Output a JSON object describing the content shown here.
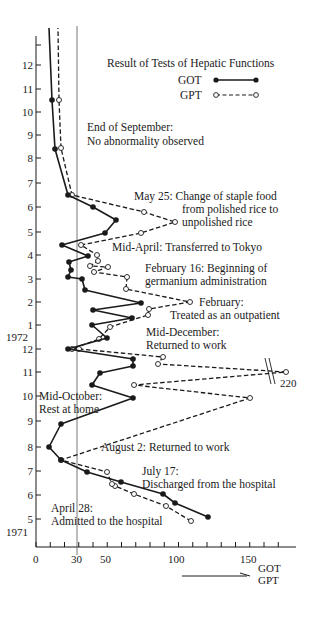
{
  "chart_data": {
    "type": "line",
    "title": "Result of Tests of Hepatic Functions",
    "xlabel": "GOT / GPT",
    "ylabel": "Month (1971-1972)",
    "xlim": [
      0,
      170
    ],
    "x_ticks": [
      0,
      30,
      50,
      100,
      150
    ],
    "x_minor_step": 10,
    "reference_line_x": 30,
    "y_ticks": [
      {
        "label": "5",
        "year": "1971"
      },
      {
        "label": "6"
      },
      {
        "label": "7"
      },
      {
        "label": "8"
      },
      {
        "label": "9"
      },
      {
        "label": "10"
      },
      {
        "label": "11"
      },
      {
        "label": "12"
      },
      {
        "label": "1",
        "year": "1972"
      },
      {
        "label": "2"
      },
      {
        "label": "3"
      },
      {
        "label": "4"
      },
      {
        "label": "5"
      },
      {
        "label": "6"
      },
      {
        "label": "7"
      },
      {
        "label": "8"
      },
      {
        "label": "9"
      },
      {
        "label": "10"
      },
      {
        "label": "11"
      },
      {
        "label": "12"
      }
    ],
    "year_labels": [
      "1971",
      "1972"
    ],
    "legend": [
      {
        "name": "GOT",
        "style": "solid line, filled circles"
      },
      {
        "name": "GPT",
        "style": "dashed line, open circles"
      }
    ],
    "legend_position": "top-right",
    "series": [
      {
        "name": "GOT",
        "approx_values_chronological": [
          120,
          98,
          95,
          58,
          51,
          36,
          18,
          24,
          44,
          69,
          68,
          23,
          50,
          45,
          9,
          24,
          32,
          17,
          41,
          17,
          73,
          40,
          25,
          16,
          26,
          31,
          50,
          38,
          21,
          57,
          48,
          12,
          23,
          11,
          8
        ]
      },
      {
        "name": "GPT",
        "approx_values_chronological": [
          110,
          91,
          69,
          55,
          53,
          50,
          16,
          150,
          69,
          220,
          86,
          89,
          31,
          26,
          45,
          53,
          54,
          108,
          64,
          63,
          41,
          40,
          51,
          38,
          43,
          32,
          45,
          101,
          124,
          76,
          25,
          16,
          13,
          12
        ]
      }
    ],
    "annotations": [
      {
        "text": "April 28:",
        "text2": "Admitted to the hospital"
      },
      {
        "text": "July 17:",
        "text2": "Discharged from the hospital"
      },
      {
        "text": "August 2:  Returned to work"
      },
      {
        "text": "Mid-October:",
        "text2": "Rest at home"
      },
      {
        "text": "Mid-December:",
        "text2": "Returned to work"
      },
      {
        "text": "February:",
        "text2": "Treated as an outpatient"
      },
      {
        "text": "February 16:  Beginning of",
        "text2": "germanium administration"
      },
      {
        "text": "Mid-April:  Transferred to Tokyo"
      },
      {
        "text": "May 25:  Change of staple food",
        "text2": "from polished rice to",
        "text3": "unpolished rice"
      },
      {
        "text": "End of September:",
        "text2": "No abnormality observed"
      }
    ],
    "break_label": "220",
    "x_arrow_labels": [
      "GOT",
      "GPT"
    ]
  },
  "render": {
    "axis_color": "#1a1a1a",
    "x_axis": {
      "y": 547,
      "x0": 36,
      "x1": 296,
      "px_per_unit": 1.425
    },
    "y_axis": {
      "x": 36,
      "top": 28
    },
    "ref_line_x": 77,
    "y_tick_px": [
      519,
      495,
      471,
      447,
      421,
      396,
      372,
      349,
      325,
      302,
      279,
      255,
      232,
      207,
      183,
      158,
      135,
      112,
      89,
      65,
      45
    ],
    "y_tick_labels": [
      "5",
      "6",
      "7",
      "8",
      "9",
      "10",
      "11",
      "12",
      "1",
      "2",
      "3",
      "4",
      "5",
      "6",
      "7",
      "8",
      "9",
      "10",
      "11",
      "12",
      ""
    ],
    "got_points": [
      [
        208,
        517
      ],
      [
        175,
        503
      ],
      [
        163,
        494
      ],
      [
        121,
        482
      ],
      [
        87,
        472
      ],
      [
        61,
        460
      ],
      [
        49,
        447
      ],
      [
        61,
        424
      ],
      [
        133,
        398
      ],
      [
        92,
        385
      ],
      [
        100,
        373
      ],
      [
        133,
        366
      ],
      [
        133,
        359
      ],
      [
        68,
        349
      ],
      [
        107,
        338
      ],
      [
        92,
        325
      ],
      [
        132,
        318
      ],
      [
        93,
        310
      ],
      [
        141,
        303
      ],
      [
        85,
        290
      ],
      [
        82,
        279
      ],
      [
        68,
        277
      ],
      [
        71,
        270
      ],
      [
        69,
        262
      ],
      [
        88,
        256
      ],
      [
        62,
        245
      ],
      [
        105,
        233
      ],
      [
        116,
        220
      ],
      [
        93,
        207
      ],
      [
        68,
        195
      ],
      [
        55,
        149
      ],
      [
        52,
        100
      ]
    ],
    "got_tail": [
      49,
      28
    ],
    "gpt_points": [
      [
        191,
        521
      ],
      [
        166,
        506
      ],
      [
        134,
        494
      ],
      [
        115,
        486
      ],
      [
        112,
        484
      ],
      [
        107,
        472
      ],
      [
        61,
        460
      ],
      [
        250,
        398
      ],
      [
        134,
        385
      ],
      [
        286,
        372
      ],
      [
        158,
        364
      ],
      [
        163,
        357
      ],
      [
        79,
        349
      ],
      [
        72,
        349
      ],
      [
        99,
        339
      ],
      [
        110,
        327
      ],
      [
        148,
        315
      ],
      [
        149,
        309
      ],
      [
        190,
        302
      ],
      [
        126,
        289
      ],
      [
        127,
        277
      ],
      [
        94,
        272
      ],
      [
        108,
        267
      ],
      [
        90,
        266
      ],
      [
        98,
        261
      ],
      [
        97,
        255
      ],
      [
        81,
        245
      ],
      [
        141,
        233
      ],
      [
        175,
        222
      ],
      [
        144,
        212
      ],
      [
        72,
        195
      ],
      [
        61,
        148
      ],
      [
        59,
        100
      ]
    ],
    "gpt_tail": [
      58,
      28
    ]
  },
  "labels": {
    "title": "Result of Tests of Hepatic Functions",
    "legend_got": "GOT",
    "legend_gpt": "GPT",
    "year_1971": "1971",
    "year_1972": "1972",
    "x_tick_0": "0",
    "x_tick_30": "30",
    "x_tick_50": "50",
    "x_tick_100": "100",
    "x_tick_150": "150",
    "break_value": "220",
    "arrow_got": "GOT",
    "arrow_gpt": "GPT",
    "ann_apr28_1": "April 28:",
    "ann_apr28_2": "Admitted to the hospital",
    "ann_jul17_1": "July 17:",
    "ann_jul17_2": "Discharged from the hospital",
    "ann_aug2": "August 2:  Returned to work",
    "ann_midoct_1": "Mid-October:",
    "ann_midoct_2": "Rest at home",
    "ann_middec_1": "Mid-December:",
    "ann_middec_2": "Returned to work",
    "ann_feb_1": "February:",
    "ann_feb_2": "Treated as an outpatient",
    "ann_feb16_1": "February 16:  Beginning of",
    "ann_feb16_2": "germanium administration",
    "ann_midapr": "Mid-April:  Transferred to Tokyo",
    "ann_may25_1": "May 25:  Change of staple food",
    "ann_may25_2": "from polished rice to",
    "ann_may25_3": "unpolished rice",
    "ann_endsep_1": "End of September:",
    "ann_endsep_2": "No abnormality observed"
  }
}
